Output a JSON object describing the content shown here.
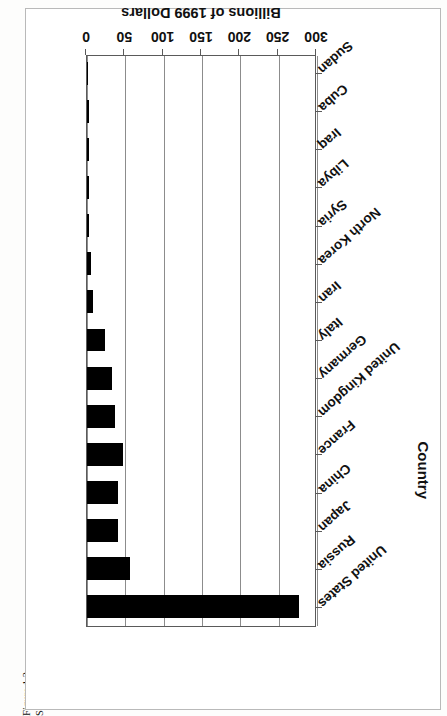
{
  "figure": {
    "number_label": "Figure 1.2",
    "caption": "Spending on National Defense in Key Nations"
  },
  "axis_title_country": "Country",
  "axis_title_value": "Billions of 1999 Dollars",
  "colors": {
    "bar": "#000000",
    "gridline": "#8c8c8c",
    "frame": "#5a5a5a",
    "plot_background": "#ffffff",
    "page_background": "#fdfdfc"
  },
  "chart_data": {
    "type": "bar",
    "orientation": "vertical",
    "title": "Spending on National Defense in Key Nations",
    "xlabel": "Country",
    "ylabel": "Billions of 1999 Dollars",
    "ylim": [
      0,
      300
    ],
    "ytick_labels": [
      "0",
      "50",
      "100",
      "150",
      "200",
      "250",
      "300"
    ],
    "yticks": [
      0,
      50,
      100,
      150,
      200,
      250,
      300
    ],
    "grid": true,
    "legend": null,
    "categories": [
      "United States",
      "Russia",
      "Japan",
      "China",
      "France",
      "United Kingdom",
      "Germany",
      "Italy",
      "Iran",
      "North Korea",
      "Syria",
      "Libya",
      "Iraq",
      "Cuba",
      "Sudan"
    ],
    "values": [
      276,
      56,
      41,
      40,
      47,
      37,
      33,
      23,
      8,
      5,
      2,
      2,
      2,
      2,
      1
    ],
    "series": [
      {
        "name": "Spending",
        "values": [
          276,
          56,
          41,
          40,
          47,
          37,
          33,
          23,
          8,
          5,
          2,
          2,
          2,
          2,
          1
        ]
      }
    ]
  }
}
